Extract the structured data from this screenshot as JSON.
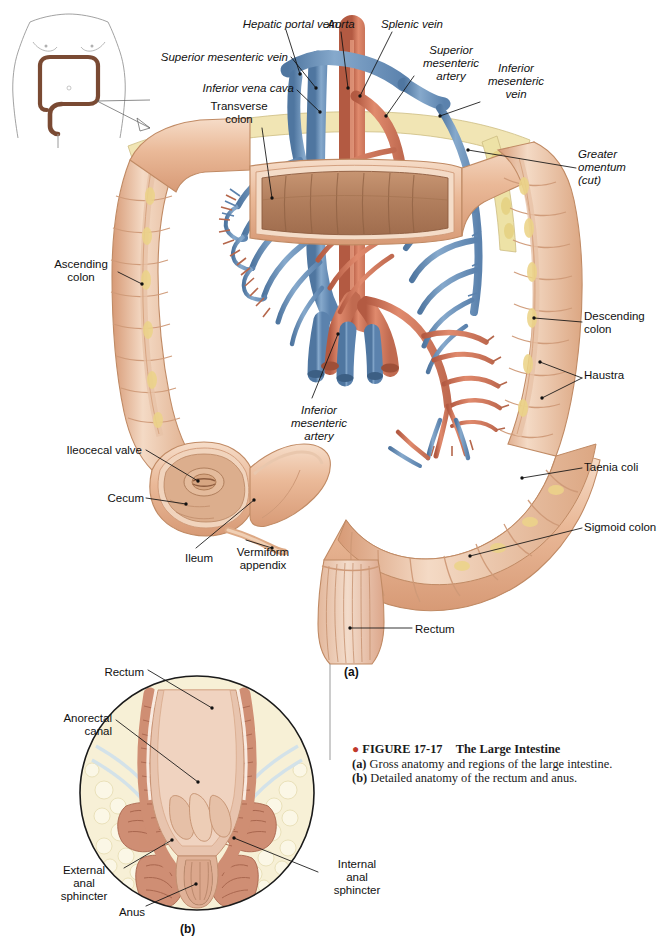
{
  "figure": {
    "number": "FIGURE 17-17",
    "title": "The Large Intestine",
    "bullet": "●",
    "caption_a_label": "(a)",
    "caption_a_text": "Gross anatomy and regions of the large intestine.",
    "caption_b_label": "(b)",
    "caption_b_text": "Detailed anatomy of the rectum and anus.",
    "panel_a_mark": "(a)",
    "panel_b_mark": "(b)"
  },
  "colors": {
    "artery": "#d4775c",
    "artery_dark": "#b35a42",
    "vein": "#6f95bd",
    "vein_dark": "#4f7characters",
    "colon": "#e9b896",
    "colon_shade": "#d79a76",
    "colon_light": "#f6ddc9",
    "mucosa": "#b7805f",
    "fat_yellow": "#e8d88a",
    "fat_pale": "#f5efcf",
    "outline": "#6b4a33",
    "leader": "#111111",
    "accent_red": "#c0392b"
  },
  "orientation_icon": {
    "name": "body-torso-colon-locator"
  },
  "panel_a": {
    "name": "gross-anatomy-large-intestine",
    "labels": [
      {
        "id": "hepatic-portal-vein",
        "text": "Hepatic portal vein",
        "style": "italic",
        "align": "right",
        "x": 214,
        "y": 18,
        "w": 124
      },
      {
        "id": "aorta",
        "text": "Aorta",
        "style": "italic",
        "align": "center",
        "x": 318,
        "y": 18,
        "w": 46
      },
      {
        "id": "splenic-vein",
        "text": "Splenic vein",
        "style": "italic",
        "align": "left",
        "x": 381,
        "y": 18,
        "w": 82
      },
      {
        "id": "superior-mesenteric-vein",
        "text": "Superior mesenteric vein",
        "style": "italic",
        "align": "right",
        "x": 146,
        "y": 51,
        "w": 142
      },
      {
        "id": "superior-mesenteric-artery",
        "text": "Superior\nmesenteric\nartery",
        "style": "italic",
        "align": "center",
        "x": 418,
        "y": 44,
        "w": 66
      },
      {
        "id": "inferior-vena-cava",
        "text": "Inferior vena cava",
        "style": "italic",
        "align": "right",
        "x": 184,
        "y": 82,
        "w": 110
      },
      {
        "id": "inferior-mesenteric-vein",
        "text": "Inferior\nmesenteric\nvein",
        "style": "italic",
        "align": "center",
        "x": 482,
        "y": 62,
        "w": 68
      },
      {
        "id": "transverse-colon",
        "text": "Transverse\ncolon",
        "style": "normal",
        "align": "center",
        "x": 200,
        "y": 100,
        "w": 78
      },
      {
        "id": "greater-omentum-cut",
        "text": "Greater\nomentum\n(cut)",
        "style": "italic",
        "align": "left",
        "x": 578,
        "y": 148,
        "w": 74
      },
      {
        "id": "ascending-colon",
        "text": "Ascending\ncolon",
        "style": "normal",
        "align": "center",
        "x": 48,
        "y": 258,
        "w": 66
      },
      {
        "id": "descending-colon",
        "text": "Descending\ncolon",
        "style": "normal",
        "align": "left",
        "x": 584,
        "y": 310,
        "w": 72
      },
      {
        "id": "haustra",
        "text": "Haustra",
        "style": "normal",
        "align": "left",
        "x": 584,
        "y": 369,
        "w": 54
      },
      {
        "id": "inferior-mesenteric-artery",
        "text": "Inferior\nmesenteric\nartery",
        "style": "italic",
        "align": "center",
        "x": 284,
        "y": 404,
        "w": 70
      },
      {
        "id": "ileocecal-valve",
        "text": "Ileocecal valve",
        "style": "normal",
        "align": "right",
        "x": 50,
        "y": 444,
        "w": 92
      },
      {
        "id": "taenia-coli",
        "text": "Taenia coli",
        "style": "normal",
        "align": "left",
        "x": 584,
        "y": 461,
        "w": 68
      },
      {
        "id": "cecum",
        "text": "Cecum",
        "style": "normal",
        "align": "right",
        "x": 100,
        "y": 492,
        "w": 44
      },
      {
        "id": "sigmoid-colon",
        "text": "Sigmoid colon",
        "style": "normal",
        "align": "left",
        "x": 584,
        "y": 521,
        "w": 84
      },
      {
        "id": "ileum",
        "text": "Ileum",
        "style": "normal",
        "align": "center",
        "x": 178,
        "y": 552,
        "w": 42
      },
      {
        "id": "vermiform-appendix",
        "text": "Vermiform\nappendix",
        "style": "normal",
        "align": "center",
        "x": 228,
        "y": 546,
        "w": 70
      },
      {
        "id": "rectum",
        "text": "Rectum",
        "style": "normal",
        "align": "left",
        "x": 415,
        "y": 623,
        "w": 52
      }
    ]
  },
  "panel_b": {
    "name": "rectum-anus-detail",
    "labels": [
      {
        "id": "rectum-inset",
        "text": "Rectum",
        "style": "normal",
        "align": "right",
        "x": 86,
        "y": 666,
        "w": 58
      },
      {
        "id": "anorectal-canal",
        "text": "Anorectal\ncanal",
        "style": "normal",
        "align": "right",
        "x": 38,
        "y": 712,
        "w": 74
      },
      {
        "id": "external-anal-sphincter",
        "text": "External\nanal\nsphincter",
        "style": "normal",
        "align": "center",
        "x": 48,
        "y": 864,
        "w": 72
      },
      {
        "id": "anus",
        "text": "Anus",
        "style": "normal",
        "align": "center",
        "x": 112,
        "y": 906,
        "w": 40
      },
      {
        "id": "internal-anal-sphincter",
        "text": "Internal\nanal\nsphincter",
        "style": "normal",
        "align": "center",
        "x": 322,
        "y": 858,
        "w": 70
      }
    ]
  }
}
